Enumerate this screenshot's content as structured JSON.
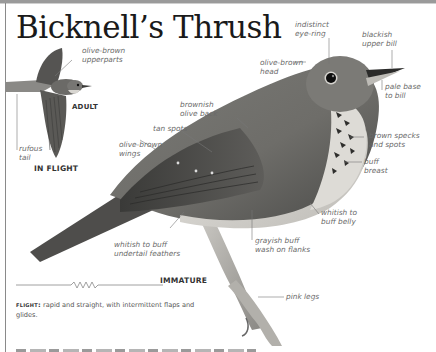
{
  "title": "Bicknell’s Thrush",
  "flight_section": {
    "views": {
      "adult": "ADULT",
      "in_flight": "IN FLIGHT"
    },
    "labels": {
      "upperparts": "olive-brown\nupperparts",
      "tail": "rufous\ntail"
    }
  },
  "main_bird": {
    "caption": "IMMATURE",
    "labels": {
      "eye_ring": "indistinct\neye-ring",
      "upper_bill": "blackish\nupper bill",
      "head": "olive-brown\nhead",
      "bill_base": "pale base\nto bill",
      "back": "brownish\nolive back",
      "tan_spots": "tan spots",
      "wings": "olive-brown\nwings",
      "specks": "brown specks\nand spots",
      "breast": "buff\nbreast",
      "belly": "whitish to\nbuff belly",
      "flanks": "grayish buff\nwash on flanks",
      "undertail": "whitish to buff\nundertail feathers",
      "legs": "pink legs"
    }
  },
  "flight_note": {
    "heading": "flight:",
    "text": " rapid and straight, with intermittent flaps and glides."
  },
  "colors": {
    "text_label": "#6a6a6a",
    "title": "#1a1a1a",
    "frame": "#8a8a8a"
  }
}
